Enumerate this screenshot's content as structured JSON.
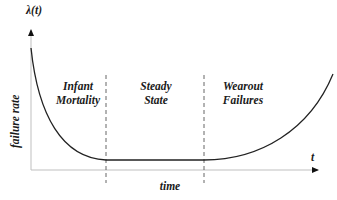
{
  "diagram": {
    "y_axis": {
      "symbol": "λ(t)",
      "label": "failure rate"
    },
    "x_axis": {
      "symbol": "t",
      "label": "time"
    },
    "regions": [
      {
        "line1": "Infant",
        "line2": "Mortality"
      },
      {
        "line1": "Steady",
        "line2": "State"
      },
      {
        "line1": "Wearout",
        "line2": "Failures"
      }
    ],
    "colors": {
      "curve": "#222222",
      "axis": "#bfbfbf",
      "divider": "#555555",
      "text": "#1a1a1a"
    }
  }
}
